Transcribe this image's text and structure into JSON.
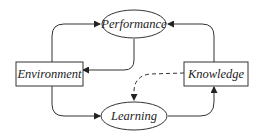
{
  "diagram": {
    "nodes": [
      {
        "id": "performance",
        "label": "Performance",
        "shape": "ellipse"
      },
      {
        "id": "environment",
        "label": "Environment",
        "shape": "rectangle"
      },
      {
        "id": "knowledge",
        "label": "Knowledge",
        "shape": "rectangle"
      },
      {
        "id": "learning",
        "label": "Learning",
        "shape": "ellipse"
      }
    ],
    "edges": [
      {
        "from": "environment",
        "to": "performance",
        "style": "solid"
      },
      {
        "from": "performance",
        "to": "environment",
        "style": "solid"
      },
      {
        "from": "environment",
        "to": "learning",
        "style": "solid"
      },
      {
        "from": "learning",
        "to": "knowledge",
        "style": "solid"
      },
      {
        "from": "knowledge",
        "to": "performance",
        "style": "solid"
      },
      {
        "from": "knowledge",
        "to": "learning",
        "style": "dashed"
      }
    ],
    "colors": {
      "stroke": "#333333",
      "background": "#ffffff",
      "text": "#222222"
    }
  }
}
